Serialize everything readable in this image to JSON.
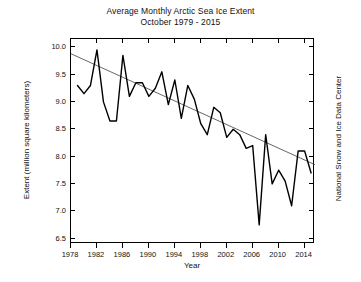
{
  "chart_data": {
    "type": "line",
    "title": "Average Monthly Arctic Sea Ice Extent",
    "subtitle": "October 1979 - 2015",
    "xlabel": "Year",
    "ylabel": "Extent (million square kilometers)",
    "credit": "National Snow and Ice Data Center",
    "xlim": [
      1978,
      2015.6
    ],
    "ylim": [
      6.4,
      10.15
    ],
    "xticks": [
      1978,
      1982,
      1986,
      1990,
      1994,
      1998,
      2002,
      2006,
      2010,
      2014
    ],
    "xticklabels": [
      "1978",
      "1982",
      "1986",
      "1990",
      "1994",
      "1998",
      "2002",
      "2006",
      "2010",
      "2014"
    ],
    "yticks": [
      6.5,
      7.0,
      7.5,
      8.0,
      8.5,
      9.0,
      9.5,
      10.0
    ],
    "yticklabels": [
      "6.5",
      "7.0",
      "7.5",
      "8.0",
      "8.5",
      "9.0",
      "9.5",
      "10.0"
    ],
    "grid": false,
    "legend": false,
    "line_color": "#000000",
    "trend_color": "#555555",
    "frame_color": "#000000",
    "background": "#ffffff",
    "x": [
      1979,
      1980,
      1981,
      1982,
      1983,
      1984,
      1985,
      1986,
      1987,
      1988,
      1989,
      1990,
      1991,
      1992,
      1993,
      1994,
      1995,
      1996,
      1997,
      1998,
      1999,
      2000,
      2001,
      2002,
      2003,
      2004,
      2005,
      2006,
      2007,
      2008,
      2009,
      2010,
      2011,
      2012,
      2013,
      2014,
      2015
    ],
    "series": [
      {
        "name": "October mean sea ice extent",
        "values": [
          9.3,
          9.15,
          9.3,
          9.95,
          9.0,
          8.65,
          8.65,
          9.85,
          9.1,
          9.35,
          9.35,
          9.1,
          9.25,
          9.55,
          8.95,
          9.4,
          8.7,
          9.3,
          9.05,
          8.6,
          8.4,
          8.9,
          8.8,
          8.35,
          8.5,
          8.4,
          8.15,
          8.2,
          6.75,
          8.4,
          7.5,
          7.75,
          7.55,
          7.1,
          8.1,
          8.1,
          7.7
        ]
      }
    ],
    "trend": {
      "name": "Linear trend",
      "x": [
        1978.0,
        2015.6
      ],
      "y": [
        9.88,
        7.85
      ]
    }
  }
}
